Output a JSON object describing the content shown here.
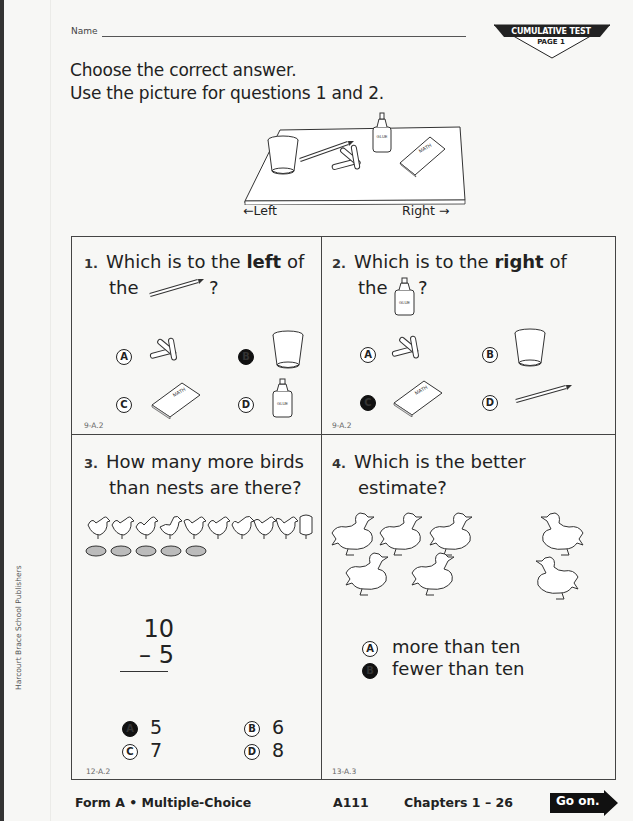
{
  "header": {
    "name_label": "Name",
    "badge_title": "CUMULATIVE TEST",
    "badge_page": "PAGE 1"
  },
  "instructions": {
    "line1": "Choose the correct answer.",
    "line2": "Use the picture for questions 1 and 2."
  },
  "scene": {
    "left_label": "←Left",
    "right_label": "Right →",
    "glue_label": "GLUE",
    "book_label": "MATH",
    "objects_left_to_right": [
      "cup",
      "pencil",
      "paper clips",
      "glue",
      "math book"
    ]
  },
  "questions": [
    {
      "number": "1.",
      "text_before": "Which is to the ",
      "emphasis": "left",
      "text_after": " of",
      "line2_prefix": "the",
      "line2_icon": "pencil",
      "line2_suffix": "?",
      "choices": [
        {
          "letter": "A",
          "item": "paper clips",
          "selected": false
        },
        {
          "letter": "B",
          "item": "cup",
          "selected": true
        },
        {
          "letter": "C",
          "item": "math book",
          "selected": false
        },
        {
          "letter": "D",
          "item": "glue",
          "selected": false
        }
      ],
      "code": "9-A.2"
    },
    {
      "number": "2.",
      "text_before": "Which is to the ",
      "emphasis": "right",
      "text_after": " of",
      "line2_prefix": "the",
      "line2_icon": "glue",
      "line2_suffix": "?",
      "choices": [
        {
          "letter": "A",
          "item": "paper clips",
          "selected": false
        },
        {
          "letter": "B",
          "item": "cup",
          "selected": false
        },
        {
          "letter": "C",
          "item": "math book",
          "selected": true
        },
        {
          "letter": "D",
          "item": "pencil",
          "selected": false
        }
      ],
      "code": "9-A.2"
    },
    {
      "number": "3.",
      "line1": "How many more birds",
      "line2": "than nests are there?",
      "bird_count": 10,
      "nest_count": 5,
      "problem_top": "10",
      "problem_bottom": "– 5",
      "choices": [
        {
          "letter": "A",
          "value": "5",
          "selected": true
        },
        {
          "letter": "B",
          "value": "6",
          "selected": false
        },
        {
          "letter": "C",
          "value": "7",
          "selected": false
        },
        {
          "letter": "D",
          "value": "8",
          "selected": false
        }
      ],
      "code": "12-A.2"
    },
    {
      "number": "4.",
      "line1": "Which is the better",
      "line2": "estimate?",
      "duck_count": 7,
      "choices": [
        {
          "letter": "A",
          "value": "more than ten",
          "selected": false
        },
        {
          "letter": "B",
          "value": "fewer than ten",
          "selected": true
        }
      ],
      "code": "13-A.3"
    }
  ],
  "footer": {
    "form": "Form A • Multiple-Choice",
    "page_code": "A111",
    "chapters": "Chapters 1 – 26",
    "go_on": "Go on."
  },
  "side": {
    "publisher": "Harcourt Brace School Publishers"
  }
}
